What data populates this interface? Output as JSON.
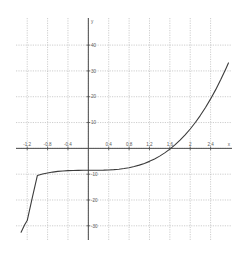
{
  "chart_data": {
    "type": "line",
    "title": "",
    "subtitle": "",
    "xlabel": "x",
    "ylabel": "y",
    "xlim": [
      -1.42,
      2.82
    ],
    "ylim": [
      -35.5,
      50.5
    ],
    "grid": true,
    "legend": null,
    "x_ticks": [
      -1.2,
      -0.8,
      -0.4,
      0.4,
      0.8,
      1.2,
      1.6,
      2,
      2.4
    ],
    "x_tick_labels": [
      "-1.2",
      "-0.8",
      "-0.4",
      "0.4",
      "0.8",
      "1.2",
      "1.6",
      "2",
      "2.4"
    ],
    "y_ticks": [
      40,
      30,
      20,
      10,
      -10,
      -20,
      -30
    ],
    "y_tick_labels": [
      "40",
      "30",
      "20",
      "10",
      "-10",
      "-20",
      "-30"
    ],
    "x_gridlines": [
      -1.2,
      -0.8,
      -0.4,
      0.0,
      0.4,
      0.8,
      1.2,
      1.6,
      2.0,
      2.4
    ],
    "y_gridlines": [
      40,
      30,
      20,
      10,
      0,
      -10,
      -20,
      -30
    ],
    "series": [
      {
        "name": "cubic",
        "equation": "y = 2x^3 - 8.5",
        "color": "#3c3c3c",
        "x": [
          -1.32,
          -1.25,
          -1.2,
          -1.1,
          -1.0,
          -0.9,
          -0.8,
          -0.7,
          -0.6,
          -0.5,
          -0.4,
          -0.3,
          -0.2,
          -0.1,
          0.0,
          0.1,
          0.2,
          0.3,
          0.4,
          0.5,
          0.6,
          0.7,
          0.8,
          0.9,
          1.0,
          1.1,
          1.2,
          1.3,
          1.4,
          1.5,
          1.6,
          1.7,
          1.8,
          1.9,
          2.0,
          2.1,
          2.2,
          2.3,
          2.4,
          2.5,
          2.6,
          2.7,
          2.75
        ],
        "y": [
          -32.5,
          -29.6,
          -27.96,
          -19.12,
          -10.5,
          -9.96,
          -9.52,
          -9.19,
          -8.93,
          -8.75,
          -8.63,
          -8.55,
          -8.52,
          -8.5,
          -8.5,
          -8.5,
          -8.48,
          -8.45,
          -8.37,
          -8.25,
          -8.07,
          -7.81,
          -7.48,
          -7.04,
          -6.5,
          -5.84,
          -5.04,
          -4.1,
          -3.01,
          -1.75,
          -0.31,
          1.33,
          3.17,
          5.22,
          7.5,
          10.02,
          12.8,
          15.83,
          19.16,
          22.75,
          26.65,
          30.87,
          33.1
        ]
      }
    ],
    "curve_features": {
      "zero_crossing_x": 1.61,
      "inflection_point": {
        "x": 0.0,
        "y": -8.5
      },
      "flat_region_y": -8.5,
      "enters_bottom_left_at": {
        "x": -1.32,
        "y": -32.5
      },
      "exits_top_right_at": {
        "x": 2.75,
        "y": 33.1
      }
    },
    "style": {
      "background": "#ffffff",
      "grid_color": "#b9b9b9",
      "axis_color": "#4a4a4a",
      "curve_color": "#3c3c3c",
      "tick_label_color": "#5a5a5a"
    }
  }
}
